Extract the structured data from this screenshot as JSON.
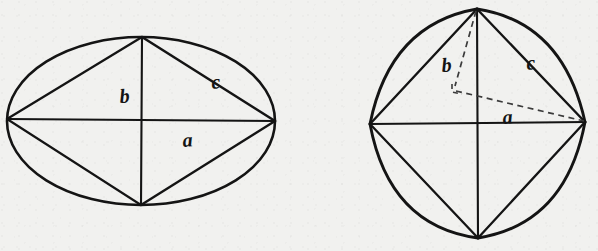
{
  "figure": {
    "kind": "geometric-line-diagram",
    "background_color": "#f1f1ef",
    "ink_color": "#141414",
    "panel_count": 2,
    "labels": {
      "a": "a",
      "b": "b",
      "c": "c"
    },
    "panels": [
      {
        "id": "left-panel",
        "name": "ellipse-with-inscribed-rhombus",
        "outline_shape": "ellipse",
        "center": {
          "x": 141,
          "y": 121
        },
        "radius_x": 134,
        "radius_y": 84,
        "vertices": {
          "top": {
            "x": 142,
            "y": 37
          },
          "bottom": {
            "x": 141,
            "y": 205
          },
          "left": {
            "x": 7,
            "y": 119
          },
          "right": {
            "x": 275,
            "y": 121
          }
        },
        "interior_lines": [
          {
            "name": "horizontal-axis-a",
            "from": "left",
            "to": "right",
            "style": "solid"
          },
          {
            "name": "vertical-axis-b",
            "from": "top",
            "to": "bottom",
            "style": "solid"
          },
          {
            "name": "chord-top-left",
            "from": "left",
            "to": "top",
            "style": "solid"
          },
          {
            "name": "chord-top-right-c",
            "from": "top",
            "to": "right",
            "style": "solid"
          },
          {
            "name": "chord-bottom-left",
            "from": "left",
            "to": "bottom",
            "style": "solid"
          },
          {
            "name": "chord-bottom-right",
            "from": "bottom",
            "to": "right",
            "style": "solid"
          }
        ],
        "label_positions": {
          "a": {
            "x": 190,
            "y": 140
          },
          "b": {
            "x": 126,
            "y": 96
          },
          "c": {
            "x": 219,
            "y": 83
          }
        }
      },
      {
        "id": "right-panel",
        "name": "lens-outline-with-inscribed-rhombus-and-dashed-projection",
        "outline_shape": "four-arc-lens",
        "vertices": {
          "top": {
            "x": 477,
            "y": 9
          },
          "bottom": {
            "x": 478,
            "y": 238
          },
          "left": {
            "x": 370,
            "y": 124
          },
          "right": {
            "x": 585,
            "y": 122
          }
        },
        "interior_lines": [
          {
            "name": "horizontal-axis",
            "from": "left",
            "to": "right",
            "style": "solid"
          },
          {
            "name": "vertical-axis",
            "from": "top",
            "to": "bottom",
            "style": "solid"
          },
          {
            "name": "chord-top-left",
            "from": "left",
            "to": "top",
            "style": "solid"
          },
          {
            "name": "chord-top-right-c",
            "from": "top",
            "to": "right",
            "style": "solid"
          },
          {
            "name": "chord-bottom-left",
            "from": "left",
            "to": "bottom",
            "style": "solid"
          },
          {
            "name": "chord-bottom-right",
            "from": "bottom",
            "to": "right",
            "style": "solid"
          }
        ],
        "dashed_lines": [
          {
            "name": "dashed-altitude-b",
            "from": {
              "x": 477,
              "y": 9
            },
            "to": {
              "x": 454,
              "y": 88
            },
            "style": "dashed"
          },
          {
            "name": "dashed-base-a",
            "from": {
              "x": 454,
              "y": 88
            },
            "to": {
              "x": 585,
              "y": 122
            },
            "style": "dashed"
          },
          {
            "name": "right-angle-mark",
            "style": "dashed"
          }
        ],
        "label_positions": {
          "a": {
            "x": 510,
            "y": 117
          },
          "b": {
            "x": 450,
            "y": 65
          },
          "c": {
            "x": 534,
            "y": 62
          }
        }
      }
    ]
  }
}
